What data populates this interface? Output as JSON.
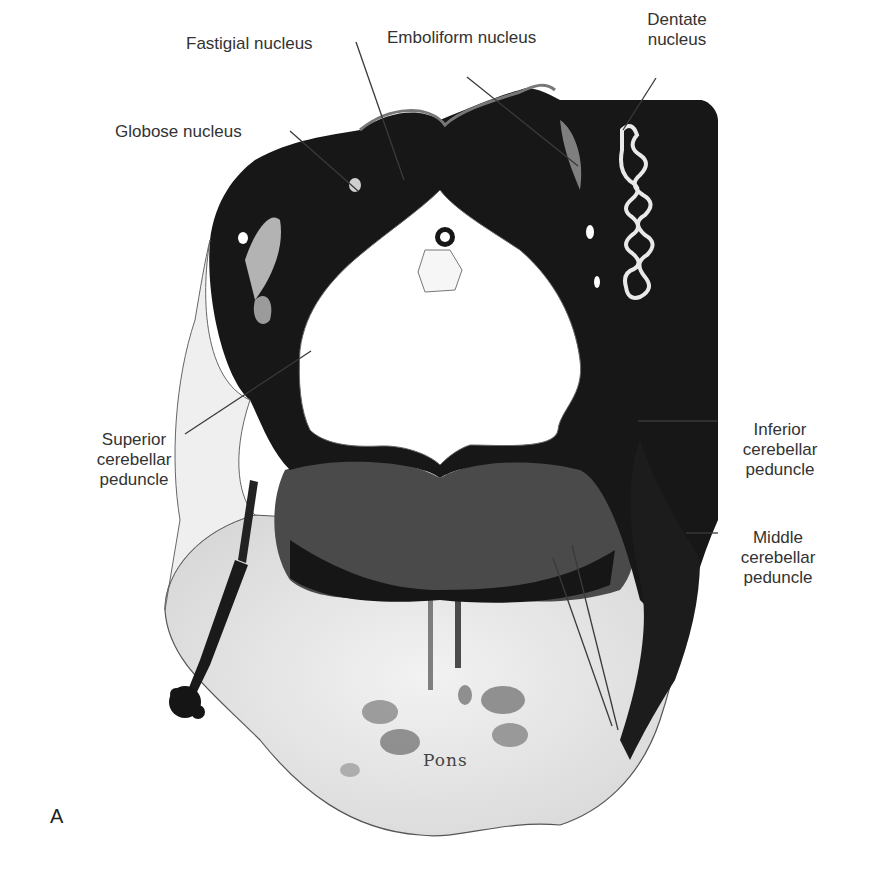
{
  "figure": {
    "panel_letter": "A",
    "type": "anatomical histology section"
  },
  "labels": {
    "fastigial": "Fastigial nucleus",
    "emboliform": "Emboliform nucleus",
    "dentate_line1": "Dentate",
    "dentate_line2": "nucleus",
    "globose": "Globose nucleus",
    "superior_line1": "Superior",
    "superior_line2": "cerebellar",
    "superior_line3": "peduncle",
    "inferior_line1": "Inferior",
    "inferior_line2": "cerebellar",
    "inferior_line3": "peduncle",
    "middle_line1": "Middle",
    "middle_line2": "cerebellar",
    "middle_line3": "peduncle",
    "pons": "Pons"
  },
  "colors": {
    "stain_dark": "#141414",
    "stain_mid": "#3a3a3a",
    "ventricle": "#ffffff",
    "leader_line": "#3a3a3a",
    "text": "#333333"
  }
}
